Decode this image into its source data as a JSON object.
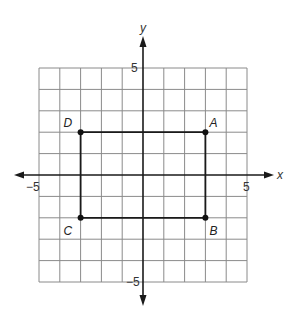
{
  "diagram": {
    "type": "coordinate-plane",
    "grid": {
      "xmin": -5,
      "xmax": 5,
      "ymin": -5,
      "ymax": 5,
      "step": 1
    },
    "axes": {
      "x_label": "x",
      "y_label": "y",
      "x_min_label": "−5",
      "x_max_label": "5",
      "y_min_label": "−5",
      "y_max_label": "5"
    },
    "points": [
      {
        "name": "A",
        "x": 3,
        "y": 2
      },
      {
        "name": "B",
        "x": 3,
        "y": -2
      },
      {
        "name": "C",
        "x": -3,
        "y": -2
      },
      {
        "name": "D",
        "x": -3,
        "y": 2
      }
    ],
    "shape": {
      "type": "rectangle",
      "vertices": [
        "A",
        "B",
        "C",
        "D"
      ]
    },
    "colors": {
      "grid": "#8a8a8a",
      "axis": "#1a1a1a",
      "shape": "#1a1a1a"
    }
  }
}
